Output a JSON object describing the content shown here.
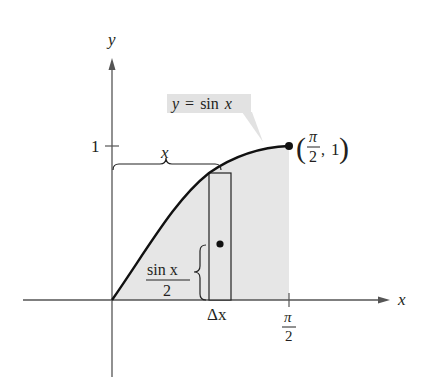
{
  "diagram": {
    "function_label": {
      "lhs": "y",
      "eq": "=",
      "fn": "sin",
      "var": "x"
    },
    "axes": {
      "x_label": "x",
      "y_label": "y",
      "y_tick_label": "1",
      "x_tick_label": {
        "num": "π",
        "den": "2"
      }
    },
    "endpoint_label": {
      "open": "(",
      "num": "π",
      "den": "2",
      "sep": ",",
      "y": "1",
      "close": ")"
    },
    "width_brace_label": "x",
    "height_brace_label": {
      "num": "sin x",
      "den": "2"
    },
    "rect_width_label": "Δx",
    "colors": {
      "curve": "#111111",
      "axis": "#555555",
      "shaded_region": "#e6e6e6",
      "label_box": "#e2e2e2",
      "text": "#231f20"
    }
  }
}
